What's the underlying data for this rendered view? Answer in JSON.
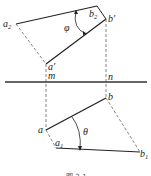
{
  "diagram": {
    "type": "descriptive-geometry-projection",
    "colors": {
      "solid": "#222222",
      "dashed": "#666666",
      "axis": "#333333"
    },
    "axis": {
      "labels": {
        "left": "m",
        "right": "n"
      }
    },
    "upper_view": {
      "points": {
        "a2": {
          "base": "a",
          "sub": "2"
        },
        "b2": {
          "base": "b",
          "sub": "2"
        },
        "b_prime": "b′",
        "a_prime": "a′"
      },
      "angle_label": "φ"
    },
    "lower_view": {
      "points": {
        "b": "b",
        "a": "a",
        "a1": {
          "base": "a",
          "sub": "1"
        },
        "b1": {
          "base": "b",
          "sub": "1"
        }
      },
      "angle_label": "θ"
    },
    "caption": "图 3-1"
  }
}
